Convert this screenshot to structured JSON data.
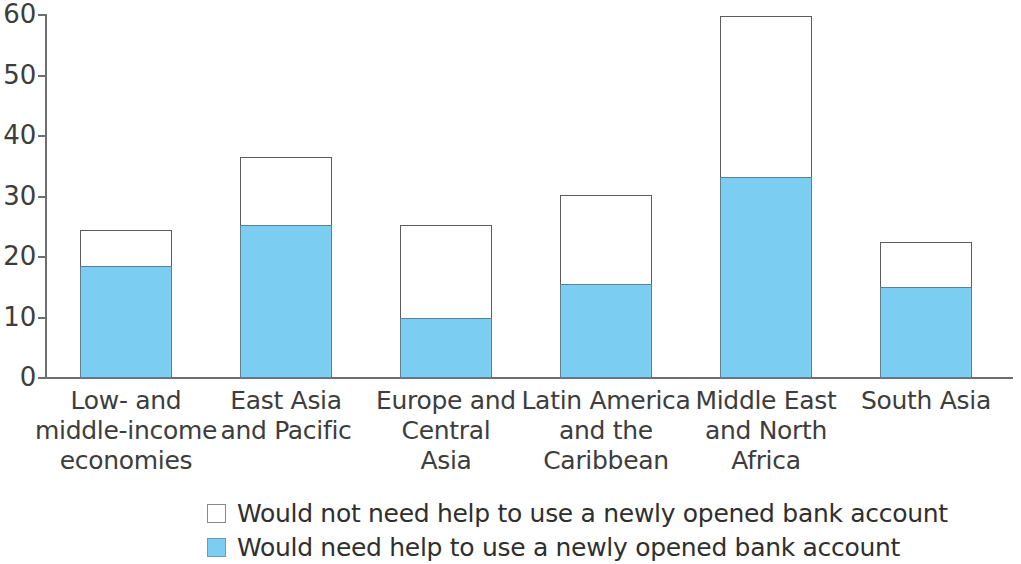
{
  "chart_data": {
    "type": "bar",
    "stacked": true,
    "title": "",
    "subtitle": "",
    "xlabel": "",
    "ylabel": "",
    "ylim": [
      0,
      60
    ],
    "yticks": [
      0,
      10,
      20,
      30,
      40,
      50,
      60
    ],
    "grid": false,
    "legend_position": "bottom",
    "categories": [
      "Low- and middle-income economies",
      "East Asia and Pacific",
      "Europe and Central Asia",
      "Latin America and the Caribbean",
      "Middle East and North Africa",
      "South Asia"
    ],
    "category_lines": [
      [
        "Low- and",
        "middle-income",
        "economies"
      ],
      [
        "East Asia",
        "and Pacific"
      ],
      [
        "Europe and",
        "Central",
        "Asia"
      ],
      [
        "Latin America",
        "and the",
        "Caribbean"
      ],
      [
        "Middle East",
        "and North",
        "Africa"
      ],
      [
        "South Asia"
      ]
    ],
    "series": [
      {
        "name": "Would need help to use a newly opened bank account",
        "color": "#7ccdf2",
        "values": [
          18.5,
          25.3,
          9.9,
          15.5,
          33.2,
          15.0
        ]
      },
      {
        "name": "Would not need help to use a newly opened bank account",
        "color": "#ffffff",
        "values": [
          6.0,
          11.2,
          15.4,
          14.8,
          26.7,
          7.4
        ]
      }
    ],
    "totals": [
      24.5,
      36.5,
      25.3,
      30.3,
      59.9,
      22.4
    ]
  },
  "legend": {
    "items": [
      {
        "label": "Would not need help to use a newly opened bank account",
        "swatch": "#ffffff"
      },
      {
        "label": "Would need help to use a newly opened bank account",
        "swatch": "#7ccdf2"
      }
    ]
  },
  "axis": {
    "y_tick_labels": [
      "60",
      "50",
      "40",
      "30",
      "20",
      "10",
      "0"
    ]
  }
}
